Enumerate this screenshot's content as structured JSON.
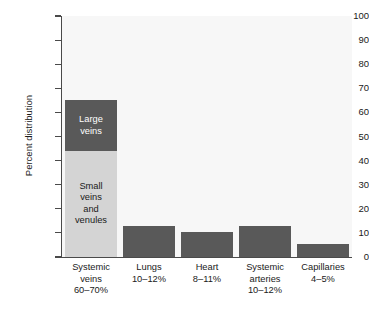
{
  "chart_data": {
    "type": "bar",
    "title": "",
    "subtitle": "",
    "xlabel": "",
    "ylabel": "Percent distribution",
    "ylim": [
      0,
      100
    ],
    "ytick_labels": [
      "100",
      "90",
      "80",
      "70",
      "60",
      "50",
      "40",
      "30",
      "20",
      "10",
      "0"
    ],
    "ytick_values": [
      100,
      90,
      80,
      70,
      60,
      50,
      40,
      30,
      20,
      10,
      0
    ],
    "grid": false,
    "legend": "none",
    "categories": [
      "Systemic veins",
      "Lungs",
      "Heart",
      "Systemic arteries",
      "Capillaries"
    ],
    "category_sublabels": [
      "60–70%",
      "10–12%",
      "8–11%",
      "10–12%",
      "4–5%"
    ],
    "values": [
      65,
      13,
      10.5,
      13,
      5.5
    ],
    "stacked": true,
    "series": [
      {
        "name": "Small veins and venules",
        "color": "#d4d4d4",
        "values": [
          44,
          0,
          0,
          0,
          0
        ],
        "label": "Small\nveins\nand\nvenules"
      },
      {
        "name": "Large veins",
        "color": "#595959",
        "values": [
          21,
          13,
          10.5,
          13,
          5.5
        ],
        "label": "Large\nveins"
      }
    ],
    "bars": [
      {
        "category": "Systemic veins",
        "sublabel": "60–70%",
        "total": 65,
        "segments": [
          {
            "name": "Small veins and venules",
            "from": 0,
            "to": 44,
            "color": "#d4d4d4",
            "label_lines": [
              "Small",
              "veins",
              "and",
              "venules"
            ]
          },
          {
            "name": "Large veins",
            "from": 44,
            "to": 65,
            "color": "#595959",
            "label_lines": [
              "Large",
              "veins"
            ]
          }
        ]
      },
      {
        "category": "Lungs",
        "sublabel": "10–12%",
        "total": 13,
        "segments": [
          {
            "name": "Lungs",
            "from": 0,
            "to": 13,
            "color": "#595959",
            "label_lines": []
          }
        ]
      },
      {
        "category": "Heart",
        "sublabel": "8–11%",
        "total": 10.5,
        "segments": [
          {
            "name": "Heart",
            "from": 0,
            "to": 10.5,
            "color": "#595959",
            "label_lines": []
          }
        ]
      },
      {
        "category": "Systemic arteries",
        "sublabel": "10–12%",
        "total": 13,
        "segments": [
          {
            "name": "Systemic arteries",
            "from": 0,
            "to": 13,
            "color": "#595959",
            "label_lines": []
          }
        ]
      },
      {
        "category": "Capillaries",
        "sublabel": "4–5%",
        "total": 5.5,
        "segments": [
          {
            "name": "Capillaries",
            "from": 0,
            "to": 5.5,
            "color": "#595959",
            "label_lines": []
          }
        ]
      }
    ]
  },
  "colors": {
    "bar_dark": "#595959",
    "bar_light": "#d4d4d4",
    "plot_background": "#f7f7f7",
    "axis": "#4a4a4a",
    "text": "#1a1a1a",
    "page_background": "#ffffff"
  },
  "axis": {
    "y_title": "Percent distribution"
  },
  "xlabels": [
    {
      "line1": "Systemic",
      "line2": "veins",
      "line3": "60–70%"
    },
    {
      "line1": "Lungs",
      "line2": "10–12%",
      "line3": ""
    },
    {
      "line1": "Heart",
      "line2": "8–11%",
      "line3": ""
    },
    {
      "line1": "Systemic",
      "line2": "arteries",
      "line3": "10–12%"
    },
    {
      "line1": "Capillaries",
      "line2": "4–5%",
      "line3": ""
    }
  ]
}
